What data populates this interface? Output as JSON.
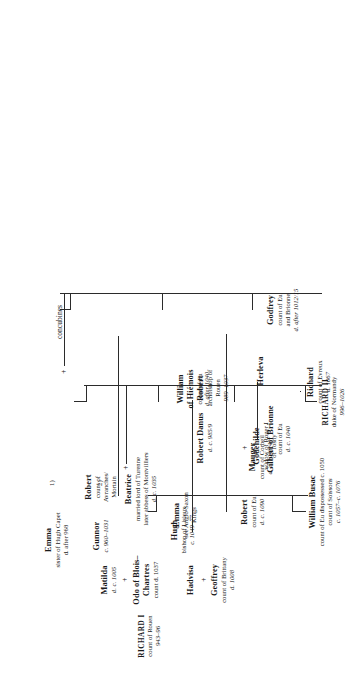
{
  "chart": {
    "type": "genealogy-tree",
    "orientation": "rotated-90",
    "nodes": [
      {
        "id": "richard1",
        "name": "RICHARD I",
        "lines": [
          "count of Rouen",
          "943–96"
        ]
      },
      {
        "id": "emma_capet",
        "name": "Emma",
        "lines": [
          "sister of Hugh Capet",
          "d. after 968"
        ],
        "marker": "1)"
      },
      {
        "id": "gunnor",
        "name": "Gunnor",
        "lines": [
          "c. 960–1031"
        ],
        "marker": "2)"
      },
      {
        "id": "concubines",
        "name": "concubines",
        "lines": []
      },
      {
        "id": "richard2",
        "name": "RICHARD II",
        "lines": [
          "duke of Normandy",
          "996–1026"
        ]
      },
      {
        "id": "mauger",
        "name": "Mauger",
        "lines": [
          "count of Corbeil",
          "d. c. 1033/40"
        ]
      },
      {
        "id": "emma_as",
        "name": "Emma",
        "lines": [
          "see Anglo-Saxon",
          "Kings"
        ]
      },
      {
        "id": "matilda",
        "name": "Matilda",
        "lines": [
          "d. c. 1005"
        ]
      },
      {
        "id": "odo",
        "name": "Odo of Blois–",
        "lines": [
          "Chartres",
          "count d. 1037"
        ]
      },
      {
        "id": "hadvisa",
        "name": "Hadvisa",
        "lines": []
      },
      {
        "id": "geoffrey_brittany",
        "name": "Geoffrey",
        "lines": [
          "count of Brittany",
          "d. 1008"
        ]
      },
      {
        "id": "godfrey",
        "name": "Godfrey",
        "lines": [
          "count of Eu",
          "and Brionne",
          "d. after 1012/15"
        ]
      },
      {
        "id": "william_hiemois",
        "name": "William",
        "lines": [
          "of Hiémois",
          "count of Eu",
          "d. after 1040"
        ]
      },
      {
        "id": "robert_avranches",
        "name": "Robert",
        "lines": [
          "count of",
          "Avranches/",
          "Mortain"
        ]
      },
      {
        "id": "gilbert_brionne",
        "name": "Gilbert of Brionne",
        "lines": [
          "count of Eu",
          "d. c. 1040"
        ]
      },
      {
        "id": "beatrice",
        "name": "Beatrice",
        "lines": [
          "married lord of Turenne",
          "later abbess of Montvilliers",
          "d. c. 1035"
        ]
      },
      {
        "id": "robert_danus",
        "name": "Robert Danus",
        "lines": [
          "d. c. 985/9"
        ]
      },
      {
        "id": "robert_rouen",
        "name": "Robert",
        "lines": [
          "archbishop of",
          "Rouen",
          "989–1037"
        ]
      },
      {
        "id": "herleva",
        "name": "Herleva",
        "lines": []
      },
      {
        "id": "godehilde",
        "name": "Godehilde",
        "lines": [
          "widow of Roger I",
          "of Tosny"
        ]
      },
      {
        "id": "richard_evreux",
        "name": "Richard",
        "lines": [
          "count of Evreux",
          "d. 1067"
        ]
      },
      {
        "id": "william_busac",
        "name": "William Busac",
        "lines": [
          "count of Eu dispossessed c. 1050",
          "count of Soissons",
          "c. 1057–c. 1076"
        ]
      },
      {
        "id": "robert_eu",
        "name": "Robert",
        "lines": [
          "count of Eu",
          "d. c. 1090"
        ]
      },
      {
        "id": "hugh_lisieux",
        "name": "Hugh",
        "lines": [
          "bishop of Lisieux",
          "c. 1049–77"
        ]
      }
    ],
    "symbols": {
      "marriage": "+",
      "marker1": "1)",
      "marker2": "2)"
    }
  }
}
